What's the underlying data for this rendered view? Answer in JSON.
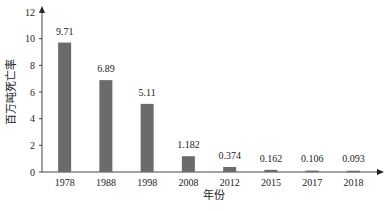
{
  "chart_data": {
    "type": "bar",
    "title": "",
    "xlabel": "年份",
    "ylabel": "百万吨死亡率",
    "categories": [
      "1978",
      "1988",
      "1998",
      "2008",
      "2012",
      "2015",
      "2017",
      "2018"
    ],
    "values": [
      9.71,
      6.89,
      5.11,
      1.182,
      0.374,
      0.162,
      0.106,
      0.093
    ],
    "data_labels": [
      "9.71",
      "6.89",
      "5.11",
      "1.182",
      "0.374",
      "0.162",
      "0.106",
      "0.093"
    ],
    "ylim": [
      0,
      12
    ],
    "yticks": [
      0,
      2,
      4,
      6,
      8,
      10,
      12
    ],
    "grid": false,
    "legend": "none",
    "bar_color": "#6b6b6b"
  }
}
